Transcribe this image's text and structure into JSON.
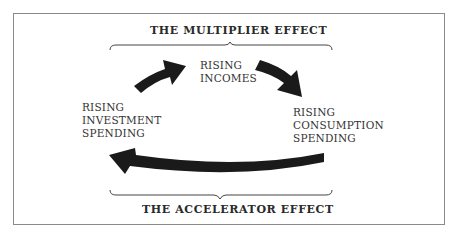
{
  "diagram": {
    "top_title": "THE MULTIPLIER EFFECT",
    "bottom_title": "THE ACCELERATOR EFFECT",
    "nodes": {
      "incomes": [
        "RISING",
        "INCOMES"
      ],
      "investment": [
        "RISING",
        "INVESTMENT",
        "SPENDING"
      ],
      "consumption": [
        "RISING",
        "CONSUMPTION",
        "SPENDING"
      ]
    },
    "arrows": [
      {
        "from": "investment",
        "to": "incomes"
      },
      {
        "from": "incomes",
        "to": "consumption"
      },
      {
        "from": "consumption",
        "to": "investment"
      }
    ],
    "colors": {
      "arrow": "#1a1a1a",
      "border": "#8a8a8a",
      "text": "#333333"
    }
  }
}
